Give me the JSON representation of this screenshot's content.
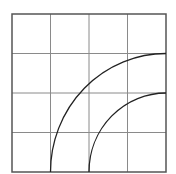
{
  "diagram": {
    "type": "grid-with-quarter-arcs",
    "grid": {
      "rows": 4,
      "cols": 4,
      "left": 12,
      "top": 14,
      "right": 166,
      "bottom": 172,
      "line_color": "#8a8a8a",
      "border_color": "#555555"
    },
    "arcs": [
      {
        "name": "outer-arc",
        "center": "bottom-right",
        "radius_cells": 3,
        "color": "#222222"
      },
      {
        "name": "inner-arc",
        "center": "bottom-right",
        "radius_cells": 2,
        "color": "#222222"
      }
    ]
  }
}
